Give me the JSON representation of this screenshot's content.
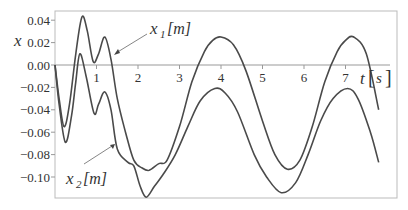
{
  "chart_data": {
    "type": "line",
    "title": "",
    "xlabel": "t [s]",
    "ylabel": "x",
    "xlim": [
      0,
      8.1
    ],
    "ylim": [
      -0.119,
      0.048
    ],
    "grid": false,
    "legend": "none (curves annotated with arrows)",
    "x_ticks": [
      1,
      2,
      3,
      4,
      5,
      6,
      7
    ],
    "y_ticks": [
      0.04,
      0.02,
      0.0,
      -0.02,
      -0.04,
      -0.06,
      -0.08,
      -0.1
    ],
    "y_tick_labels": [
      "0.04",
      "0.02",
      "0.00",
      "−0.02",
      "−0.04",
      "−0.06",
      "−0.08",
      "−0.10"
    ],
    "series": [
      {
        "name": "x1 [m]",
        "x": [
          0,
          0.1,
          0.22,
          0.35,
          0.5,
          0.65,
          0.78,
          0.92,
          1.05,
          1.2,
          1.35,
          1.5,
          1.7,
          1.9,
          2.1,
          2.27,
          2.5,
          2.7,
          3.0,
          3.3,
          3.6,
          3.8,
          4.0,
          4.3,
          4.6,
          5.0,
          5.3,
          5.6,
          5.9,
          6.2,
          6.5,
          6.8,
          7.0,
          7.2,
          7.5,
          7.8
        ],
        "values": [
          0.0,
          -0.03,
          -0.055,
          -0.035,
          0.01,
          0.043,
          0.03,
          0.003,
          0.01,
          0.025,
          0.005,
          -0.03,
          -0.06,
          -0.085,
          -0.092,
          -0.094,
          -0.088,
          -0.085,
          -0.055,
          -0.015,
          0.012,
          0.022,
          0.025,
          0.018,
          -0.005,
          -0.05,
          -0.08,
          -0.093,
          -0.085,
          -0.055,
          -0.015,
          0.012,
          0.022,
          0.025,
          0.01,
          -0.04
        ]
      },
      {
        "name": "x2 [m]",
        "x": [
          0,
          0.1,
          0.25,
          0.4,
          0.5,
          0.6,
          0.75,
          0.94,
          1.05,
          1.2,
          1.35,
          1.5,
          1.76,
          1.9,
          2.05,
          2.2,
          2.4,
          2.6,
          2.9,
          3.2,
          3.5,
          3.85,
          4.1,
          4.4,
          4.8,
          5.1,
          5.45,
          5.8,
          6.1,
          6.4,
          6.7,
          7.05,
          7.3,
          7.6,
          7.8
        ],
        "values": [
          0.0,
          -0.035,
          -0.069,
          -0.045,
          -0.015,
          0.01,
          -0.01,
          -0.043,
          -0.035,
          -0.024,
          -0.04,
          -0.075,
          -0.087,
          -0.09,
          -0.108,
          -0.118,
          -0.108,
          -0.098,
          -0.08,
          -0.055,
          -0.032,
          -0.021,
          -0.025,
          -0.042,
          -0.08,
          -0.1,
          -0.114,
          -0.105,
          -0.08,
          -0.05,
          -0.03,
          -0.021,
          -0.03,
          -0.06,
          -0.087
        ]
      }
    ],
    "annotations": [
      {
        "text": "x1 [m]",
        "points_to_series": "x1 [m]"
      },
      {
        "text": "x2 [m]",
        "points_to_series": "x2 [m]"
      }
    ]
  },
  "labels": {
    "y_axis": "x",
    "x_axis_var": "t",
    "x_axis_unit_open": "[",
    "x_axis_unit": "s",
    "x_axis_unit_close": "]",
    "x1_var": "x",
    "x1_sub": "1",
    "x1_unit": "[m]",
    "x2_var": "x",
    "x2_sub": "2",
    "x2_unit": "[m]"
  },
  "style": {
    "line_color": "#4a4a4a",
    "axis_color": "#999999",
    "border_color": "#bbbbbb"
  }
}
